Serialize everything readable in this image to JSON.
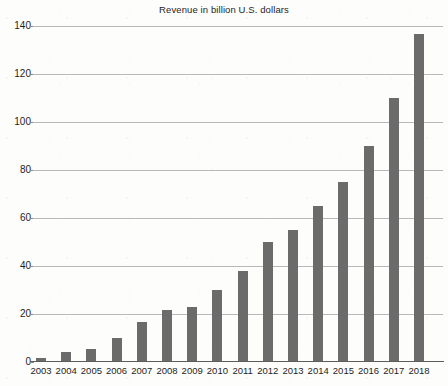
{
  "chart_data": {
    "type": "bar",
    "title": "Revenue in billion U.S. dollars",
    "xlabel": "",
    "ylabel": "",
    "categories": [
      "2003",
      "2004",
      "2005",
      "2006",
      "2007",
      "2008",
      "2009",
      "2010",
      "2011",
      "2012",
      "2013",
      "2014",
      "2015",
      "2016",
      "2017",
      "2018"
    ],
    "values": [
      1.5,
      4,
      5.5,
      10,
      16.5,
      21.7,
      23,
      30,
      38,
      50,
      55,
      65,
      75,
      90,
      110,
      136.7
    ],
    "ylim": [
      0,
      140
    ],
    "ytick_labels": [
      "0",
      "20",
      "40",
      "60",
      "80",
      "100",
      "120",
      "140"
    ],
    "ytick_values": [
      0,
      20,
      40,
      60,
      80,
      100,
      120,
      140
    ],
    "grid": true,
    "legend": "none",
    "bar_color": "#6b6b6b",
    "gridline_color": "#b9b9b9",
    "axis_color": "#5d5d5d",
    "background_color": "#fdfdfc"
  }
}
